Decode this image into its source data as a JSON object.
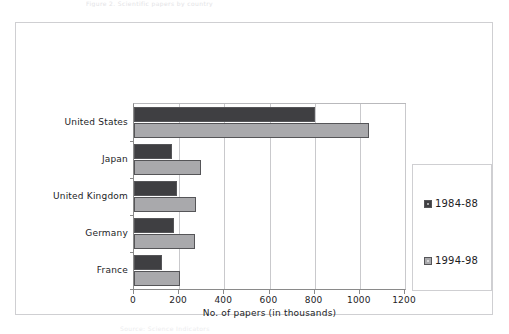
{
  "page": {
    "top_margin_text": "Figure 2.  Scientific papers by country",
    "bottom_margin_text": "Source: Science Indicators"
  },
  "chart_data": {
    "type": "bar",
    "orientation": "horizontal",
    "title": "",
    "subtitle": "",
    "xlabel": "No. of papers (in thousands)",
    "ylabel": "",
    "categories": [
      "United States",
      "Japan",
      "United Kingdom",
      "Germany",
      "France"
    ],
    "series": [
      {
        "name": "1984-88",
        "color": "#3f3f42",
        "values": [
          800,
          170,
          190,
          175,
          125
        ]
      },
      {
        "name": "1994-98",
        "color": "#a9a9ac",
        "values": [
          1040,
          295,
          275,
          270,
          205
        ]
      }
    ],
    "xlim": [
      0,
      1200
    ],
    "xticks": [
      0,
      200,
      400,
      600,
      800,
      1000,
      1200
    ],
    "xtick_labels": [
      "0",
      "200",
      "400",
      "600",
      "800",
      "1000",
      "1200"
    ],
    "grid": true,
    "grid_axis": "x",
    "legend": {
      "position": "right",
      "entries": [
        "1984-88",
        "1994-98"
      ]
    }
  }
}
